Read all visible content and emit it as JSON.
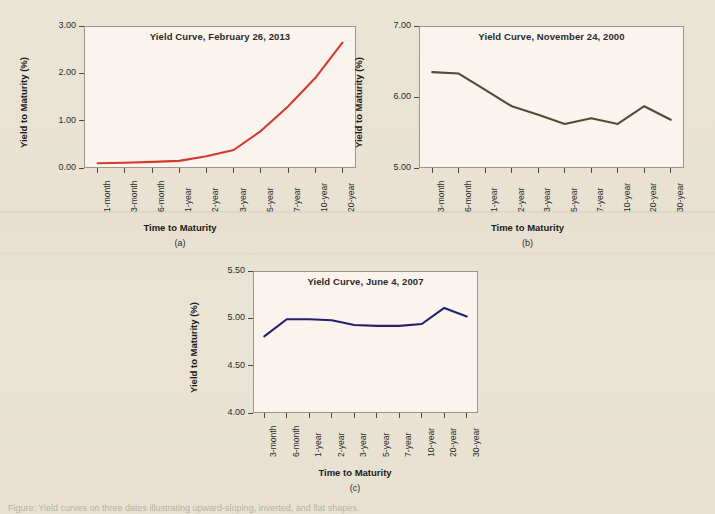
{
  "figure": {
    "background_color": "#e9e3d3",
    "plot_background_color": "#faf3ee",
    "axis_color": "#9a968c",
    "caption": "Figure:  Yield curves on three dates illustrating upward-sloping, inverted, and flat shapes."
  },
  "chart_data": [
    {
      "type": "line",
      "panel": "(a)",
      "title": "Yield Curve, February 26, 2013",
      "xlabel": "Time to Maturity",
      "ylabel": "Yield to Maturity (%)",
      "line_color": "#d4392a",
      "grid": false,
      "legend": "none",
      "ylim": [
        0.0,
        3.0
      ],
      "yticks": [
        "0.00",
        "1.00",
        "2.00",
        "3.00"
      ],
      "ytick_values": [
        0.0,
        1.0,
        2.0,
        3.0
      ],
      "categories": [
        "1-month",
        "3-month",
        "6-month",
        "1-year",
        "2-year",
        "3-year",
        "5-year",
        "7-year",
        "10-year",
        "20-year"
      ],
      "values": [
        0.1,
        0.11,
        0.13,
        0.15,
        0.25,
        0.38,
        0.78,
        1.3,
        1.9,
        2.65
      ]
    },
    {
      "type": "line",
      "panel": "(b)",
      "title": "Yield Curve, November 24, 2000",
      "xlabel": "Time to Maturity",
      "ylabel": "Yield to Maturity (%)",
      "line_color": "#4a5036",
      "grid": false,
      "legend": "none",
      "ylim": [
        5.0,
        7.0
      ],
      "yticks": [
        "5.00",
        "6.00",
        "7.00"
      ],
      "ytick_values": [
        5.0,
        6.0,
        7.0
      ],
      "categories": [
        "3-month",
        "6-month",
        "1-year",
        "2-year",
        "3-year",
        "5-year",
        "7-year",
        "10-year",
        "20-year",
        "30-year"
      ],
      "values": [
        6.35,
        6.33,
        6.1,
        5.87,
        5.75,
        5.62,
        5.7,
        5.62,
        5.87,
        5.68
      ]
    },
    {
      "type": "line",
      "panel": "(c)",
      "title": "Yield Curve, June 4, 2007",
      "xlabel": "Time to Maturity",
      "ylabel": "Yield to Maturity (%)",
      "line_color": "#232070",
      "grid": false,
      "legend": "none",
      "ylim": [
        4.0,
        5.5
      ],
      "yticks": [
        "4.00",
        "4.50",
        "5.00",
        "5.50"
      ],
      "ytick_values": [
        4.0,
        4.5,
        5.0,
        5.5
      ],
      "categories": [
        "3-month",
        "6-month",
        "1-year",
        "2-year",
        "3-year",
        "5-year",
        "7-year",
        "10-year",
        "20-year",
        "30-year"
      ],
      "values": [
        4.81,
        4.99,
        4.99,
        4.98,
        4.93,
        4.92,
        4.92,
        4.94,
        5.11,
        5.02
      ]
    }
  ]
}
